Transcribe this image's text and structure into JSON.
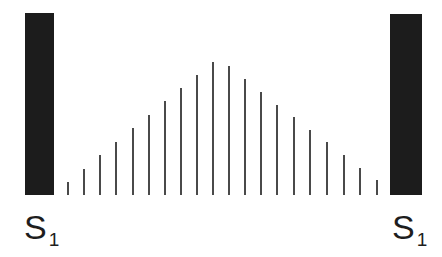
{
  "diagram": {
    "type": "diffraction-intensity-pattern",
    "colors": {
      "slit": "#1c1c1c",
      "line": "#4a4a4a",
      "text": "#1e1e1e",
      "background": "#ffffff"
    },
    "baseline_y": 195,
    "slits": [
      {
        "label": "S",
        "subscript": "1",
        "x": 25,
        "width": 29,
        "top": 13,
        "label_x": 24
      },
      {
        "label": "S",
        "subscript": "1",
        "x": 390,
        "width": 32,
        "top": 14,
        "label_x": 392
      }
    ],
    "lines": [
      {
        "x": 67,
        "top": 182
      },
      {
        "x": 83,
        "top": 169
      },
      {
        "x": 99,
        "top": 155
      },
      {
        "x": 115,
        "top": 142
      },
      {
        "x": 132,
        "top": 128
      },
      {
        "x": 148,
        "top": 115
      },
      {
        "x": 164,
        "top": 101
      },
      {
        "x": 180,
        "top": 88
      },
      {
        "x": 196,
        "top": 75
      },
      {
        "x": 212,
        "top": 62
      },
      {
        "x": 228,
        "top": 66
      },
      {
        "x": 244,
        "top": 79
      },
      {
        "x": 260,
        "top": 92
      },
      {
        "x": 276,
        "top": 105
      },
      {
        "x": 293,
        "top": 117
      },
      {
        "x": 309,
        "top": 130
      },
      {
        "x": 326,
        "top": 142
      },
      {
        "x": 343,
        "top": 155
      },
      {
        "x": 359,
        "top": 168
      },
      {
        "x": 376,
        "top": 180
      }
    ]
  }
}
